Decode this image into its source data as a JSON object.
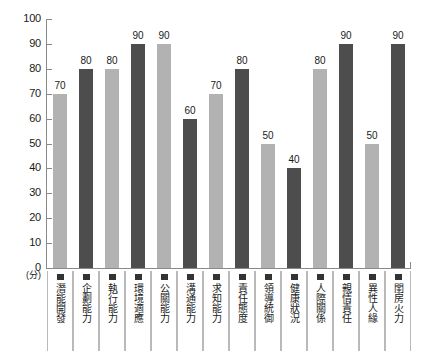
{
  "chart_data": {
    "type": "bar",
    "title": "",
    "xlabel": "",
    "ylabel": "",
    "unit_label": "(分)",
    "ylim": [
      0,
      100
    ],
    "ytick_labels": [
      "100",
      "90",
      "80",
      "70",
      "60",
      "50",
      "40",
      "30",
      "20",
      "10",
      "0"
    ],
    "yticks": [
      100,
      90,
      80,
      70,
      60,
      50,
      40,
      30,
      20,
      10,
      0
    ],
    "grid": false,
    "legend": "none",
    "categories": [
      "潛能開發",
      "企劃能力",
      "執行能力",
      "環境適應",
      "公關能力",
      "溝通能力",
      "求知能力",
      "責任態度",
      "領導統御",
      "健康狀況",
      "人際關係",
      "親情責任",
      "異性人緣",
      "閨房火力"
    ],
    "values": [
      70,
      80,
      80,
      90,
      90,
      60,
      70,
      80,
      50,
      40,
      80,
      90,
      50,
      90
    ],
    "value_labels": [
      "70",
      "80",
      "80",
      "90",
      "90",
      "60",
      "70",
      "80",
      "50",
      "40",
      "80",
      "90",
      "50",
      "90"
    ],
    "bar_colors": [
      "#b2b2b2",
      "#4d4d4d",
      "#b2b2b2",
      "#4d4d4d",
      "#b2b2b2",
      "#4d4d4d",
      "#b2b2b2",
      "#4d4d4d",
      "#b2b2b2",
      "#4d4d4d",
      "#b2b2b2",
      "#4d4d4d",
      "#b2b2b2",
      "#4d4d4d"
    ],
    "palette": {
      "light": "#b2b2b2",
      "dark": "#4d4d4d",
      "axis": "#8a8a8a",
      "text": "#1a1a1a",
      "background": "#ffffff",
      "cell_border": "#b9b9b9",
      "marker": "#333333"
    }
  }
}
